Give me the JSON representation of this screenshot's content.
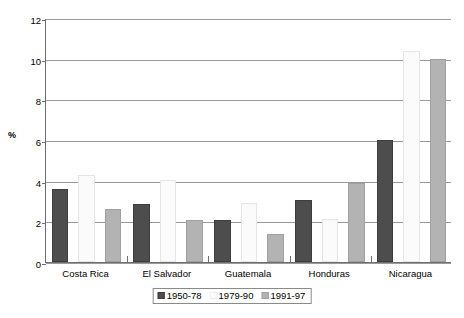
{
  "chart_data": {
    "type": "bar",
    "title": "",
    "xlabel": "",
    "ylabel": "%",
    "ylim": [
      0,
      12
    ],
    "yticks": [
      0,
      2,
      4,
      6,
      8,
      10,
      12
    ],
    "ytick_labels": [
      "0",
      "2",
      "4",
      "6",
      "8",
      "10",
      "12"
    ],
    "grid": true,
    "legend_position": "bottom",
    "categories": [
      "Costa Rica",
      "El Salvador",
      "Guatemala",
      "Honduras",
      "Nicaragua"
    ],
    "series": [
      {
        "name": "1950-78",
        "color": "#4d4d4d",
        "values": [
          3.6,
          2.85,
          2.05,
          3.05,
          6.0
        ]
      },
      {
        "name": "1979-90",
        "color": "#fbfbfb",
        "values": [
          4.3,
          4.05,
          2.9,
          2.1,
          10.4
        ]
      },
      {
        "name": "1991-97",
        "color": "#b3b3b3",
        "values": [
          2.6,
          2.05,
          1.4,
          3.9,
          10.0
        ]
      }
    ]
  }
}
